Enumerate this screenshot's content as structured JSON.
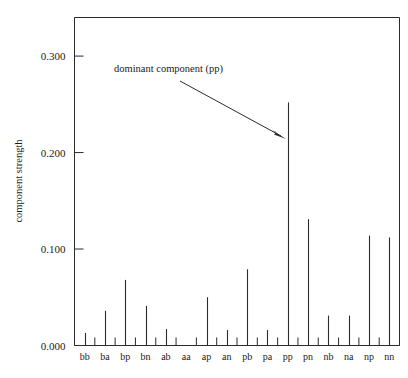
{
  "chart_data": {
    "type": "bar",
    "title": "",
    "subtitle": "",
    "xlabel": "",
    "ylabel": "component strength",
    "categories": [
      "bb",
      "ba",
      "bp",
      "bn",
      "ab",
      "aa",
      "ap",
      "an",
      "pb",
      "pa",
      "pp",
      "pn",
      "nb",
      "na",
      "np",
      "nn"
    ],
    "values": [
      0.013,
      0.036,
      0.068,
      0.041,
      0.017,
      0.0,
      0.05,
      0.016,
      0.079,
      0.016,
      0.252,
      0.131,
      0.031,
      0.031,
      0.114,
      0.112
    ],
    "ylim": [
      0.0,
      0.34
    ],
    "xlim": [
      0,
      16
    ],
    "yticks": [
      0.0,
      0.1,
      0.2,
      0.3
    ],
    "ytick_labels": [
      "0.000",
      "0.100",
      "0.200",
      "0.300"
    ],
    "grid": false,
    "legend": false,
    "legend_position": "none",
    "bar_style": "thin-stem",
    "annotations": [
      {
        "text": "dominant component (pp)",
        "target_category": "pp",
        "target_value": 0.2,
        "arrow": true
      }
    ]
  },
  "axes": {
    "y_axis_title": "component strength",
    "y_tick_labels": [
      "0.300",
      "0.200",
      "0.100",
      "0.000"
    ],
    "x_tick_labels": [
      "bb",
      "ba",
      "bp",
      "bn",
      "ab",
      "aa",
      "ap",
      "an",
      "pb",
      "pa",
      "pp",
      "pn",
      "nb",
      "na",
      "np",
      "nn"
    ]
  },
  "annotation": {
    "text": "dominant component (pp)"
  },
  "colors": {
    "ink": "#2b2b2b",
    "background": "#ffffff",
    "text": "#1a1a1a"
  }
}
